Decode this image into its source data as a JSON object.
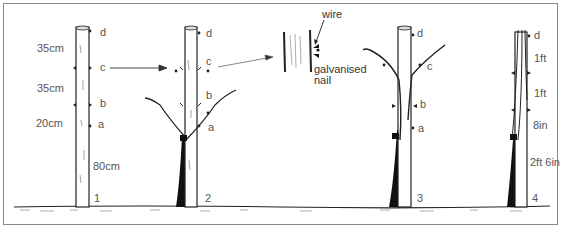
{
  "figure": {
    "stages": [
      {
        "number": "1",
        "wire_labels": [
          "d",
          "c",
          "b",
          "a"
        ],
        "spacings": [
          "35cm",
          "35cm",
          "20cm",
          "80cm"
        ]
      },
      {
        "number": "2",
        "wire_labels": [
          "d",
          "c",
          "b",
          "a"
        ]
      },
      {
        "number": "3",
        "wire_labels": [
          "d",
          "c",
          "b",
          "a"
        ]
      },
      {
        "number": "4",
        "wire_labels": [
          "d"
        ],
        "spacings": [
          "1ft",
          "1ft",
          "8in",
          "2ft 6in"
        ]
      }
    ],
    "inset": {
      "wire_label": "wire",
      "nail_label": "galvanised",
      "nail_label_2": "nail"
    }
  }
}
